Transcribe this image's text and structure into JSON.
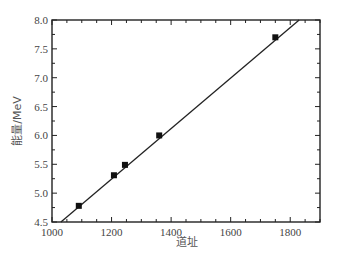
{
  "chart_data": {
    "type": "scatter",
    "title": "",
    "xlabel": "道址",
    "ylabel": "能量/MeV",
    "xlim": [
      1000,
      1900
    ],
    "ylim": [
      4.5,
      8.0
    ],
    "x_ticks": [
      1000,
      1200,
      1400,
      1600,
      1800
    ],
    "x_tick_labels": [
      "1000",
      "1200",
      "1400",
      "1600",
      "1800"
    ],
    "y_ticks": [
      4.5,
      5.0,
      5.5,
      6.0,
      6.5,
      7.0,
      7.5,
      8.0
    ],
    "y_tick_labels": [
      "4.5",
      "5.0",
      "5.5",
      "6.0",
      "6.5",
      "7.0",
      "7.5",
      "8.0"
    ],
    "grid": false,
    "legend": null,
    "series": [
      {
        "name": "calibration points",
        "marker": "square",
        "color": "#111111",
        "x": [
          1090,
          1208,
          1245,
          1360,
          1750
        ],
        "y": [
          4.78,
          5.31,
          5.49,
          6.0,
          7.7
        ]
      },
      {
        "name": "linear fit",
        "style": "line",
        "color": "#222222",
        "x": [
          1030,
          1830
        ],
        "y": [
          4.5,
          8.0
        ]
      }
    ]
  }
}
